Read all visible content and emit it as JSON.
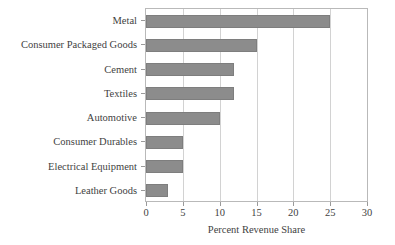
{
  "chart_data": {
    "type": "bar",
    "orientation": "horizontal",
    "title": "",
    "xlabel": "Percent Revenue Share",
    "ylabel": "",
    "categories": [
      "Metal",
      "Consumer Packaged Goods",
      "Cement",
      "Textiles",
      "Automotive",
      "Consumer Durables",
      "Electrical Equipment",
      "Leather Goods"
    ],
    "values": [
      25,
      15,
      12,
      12,
      10,
      5,
      5,
      3
    ],
    "xlim": [
      0,
      30
    ],
    "xticks": [
      0,
      5,
      10,
      15,
      20,
      25,
      30
    ],
    "xtick_labels": [
      "0",
      "5",
      "10",
      "15",
      "20",
      "25",
      "30"
    ],
    "grid": "vertical",
    "legend": "none",
    "bar_color": "#8c8c8c",
    "bar_edge_color": "#7e7e7e",
    "gridline_color": "#d2d2d2",
    "axis_color": "#b9b9b9",
    "text_color": "#3f3f3f",
    "background_color": "#ffffff"
  }
}
